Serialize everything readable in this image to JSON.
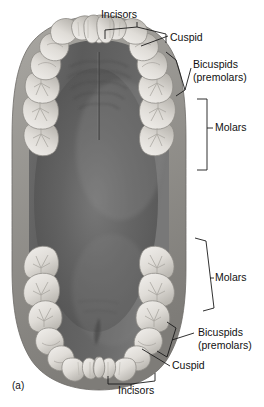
{
  "figure": {
    "panel_label": "(a)",
    "caption_subject": "occlusal view of upper and lower dental arches",
    "background_color": "#ffffff",
    "ink_color": "#1a1a1a",
    "oral_cavity_color": "#5a5a5a",
    "oral_cavity_highlight": "#8e8e8e",
    "tooth_fill_color": "#e8e6e2",
    "tooth_shadow_color": "#b9b6b1",
    "gum_color": "#9a9894"
  },
  "annotations": {
    "upper": [
      {
        "id": "upper-incisors",
        "label": "Incisors",
        "sublabel": "",
        "marker": "bracket",
        "text_x": 119,
        "text_y": 18
      },
      {
        "id": "upper-cuspid",
        "label": "Cuspid",
        "sublabel": "",
        "marker": "leader",
        "text_x": 170,
        "text_y": 41
      },
      {
        "id": "upper-bicuspids",
        "label": "Bicuspids",
        "sublabel": "(premolars)",
        "marker": "bracket",
        "text_x": 193,
        "text_y": 68
      },
      {
        "id": "upper-molars",
        "label": "Molars",
        "sublabel": "",
        "marker": "bracket",
        "text_x": 215,
        "text_y": 131
      }
    ],
    "lower": [
      {
        "id": "lower-molars",
        "label": "Molars",
        "sublabel": "",
        "marker": "bracket",
        "text_x": 215,
        "text_y": 281
      },
      {
        "id": "lower-bicuspids",
        "label": "Bicuspids",
        "sublabel": "(premolars)",
        "marker": "bracket",
        "text_x": 198,
        "text_y": 336
      },
      {
        "id": "lower-cuspid",
        "label": "Cuspid",
        "sublabel": "",
        "marker": "leader",
        "text_x": 172,
        "text_y": 369
      },
      {
        "id": "lower-incisors",
        "label": "Incisors",
        "sublabel": "",
        "marker": "bracket",
        "text_x": 118,
        "text_y": 394
      }
    ]
  },
  "tooth_groups": {
    "upper_incisors_count": 4,
    "upper_cuspids_count": 2,
    "upper_bicuspids_count": 4,
    "upper_molars_count": 6,
    "lower_incisors_count": 4,
    "lower_cuspids_count": 2,
    "lower_bicuspids_count": 4,
    "lower_molars_count": 6
  }
}
